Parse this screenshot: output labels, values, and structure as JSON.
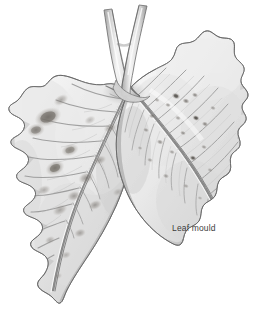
{
  "figure": {
    "title": "Leaf mould",
    "medium": "graphite pencil botanical illustration",
    "background_color": "#ffffff",
    "width": 259,
    "height": 312
  },
  "caption": {
    "label": "Leaf mould",
    "color": "#3b3b3b",
    "x": 172,
    "y": 223
  },
  "palette": {
    "background": "#ffffff",
    "outline": "#5a5a5a",
    "outline_dark": "#3f3f3f",
    "leaf_light": "#f2f2f2",
    "leaf_mid": "#d8d8d8",
    "leaf_shadow": "#b4b4b4",
    "vein": "#8c8c8c",
    "vein_dark": "#6e6e6e",
    "lesion": "#7a7570",
    "lesion_dark": "#58544f",
    "stem_light": "#ebebeb",
    "stem_shadow": "#a9a9a9"
  },
  "parts": [
    {
      "name": "petiole-left-branch",
      "label": "Left stem branch",
      "description": "slender stalk rising from the leaflet junction to the top edge"
    },
    {
      "name": "petiole-right-branch",
      "label": "Right stem branch",
      "description": "second slender stalk crossing the first near the top"
    },
    {
      "name": "leaflet-left",
      "label": "Left leaflet",
      "description": "large serrated leaflet angled down-left with dark blotchy lesions"
    },
    {
      "name": "leaflet-right",
      "label": "Right leaflet",
      "description": "serrated leaflet angled down-right with small scattered dark specks"
    },
    {
      "name": "midrib-left",
      "label": "Left leaflet midrib"
    },
    {
      "name": "midrib-right",
      "label": "Right leaflet midrib"
    }
  ],
  "lesions": {
    "left_leaflet": [
      {
        "cx": 48,
        "cy": 117,
        "rx": 11,
        "ry": 6.5,
        "rot": -22,
        "tone": 0.62
      },
      {
        "cx": 36,
        "cy": 130,
        "rx": 7,
        "ry": 5,
        "rot": -14,
        "tone": 0.48
      },
      {
        "cx": 61,
        "cy": 100,
        "rx": 6,
        "ry": 4,
        "rot": -30,
        "tone": 0.38
      },
      {
        "cx": 70,
        "cy": 150,
        "rx": 7,
        "ry": 5,
        "rot": -18,
        "tone": 0.46
      },
      {
        "cx": 55,
        "cy": 168,
        "rx": 8,
        "ry": 5.5,
        "rot": -25,
        "tone": 0.55
      },
      {
        "cx": 86,
        "cy": 178,
        "rx": 6,
        "ry": 4.5,
        "rot": -20,
        "tone": 0.44
      },
      {
        "cx": 74,
        "cy": 196,
        "rx": 5,
        "ry": 4,
        "rot": -16,
        "tone": 0.4
      },
      {
        "cx": 95,
        "cy": 205,
        "rx": 5,
        "ry": 3.5,
        "rot": -22,
        "tone": 0.42
      },
      {
        "cx": 60,
        "cy": 210,
        "rx": 6,
        "ry": 4,
        "rot": -28,
        "tone": 0.36
      },
      {
        "cx": 44,
        "cy": 190,
        "rx": 5,
        "ry": 3.5,
        "rot": -20,
        "tone": 0.34
      },
      {
        "cx": 80,
        "cy": 233,
        "rx": 4.5,
        "ry": 3.2,
        "rot": -18,
        "tone": 0.38
      },
      {
        "cx": 50,
        "cy": 240,
        "rx": 4,
        "ry": 3,
        "rot": -24,
        "tone": 0.3
      },
      {
        "cx": 100,
        "cy": 160,
        "rx": 5,
        "ry": 3.5,
        "rot": -20,
        "tone": 0.35
      },
      {
        "cx": 110,
        "cy": 128,
        "rx": 5,
        "ry": 3.5,
        "rot": -24,
        "tone": 0.4
      },
      {
        "cx": 66,
        "cy": 255,
        "rx": 4,
        "ry": 2.8,
        "rot": -20,
        "tone": 0.28
      }
    ],
    "right_leaflet": [
      {
        "cx": 176,
        "cy": 96,
        "rx": 3.0,
        "ry": 2.2,
        "rot": 20,
        "tone": 0.52
      },
      {
        "cx": 186,
        "cy": 101,
        "rx": 2.4,
        "ry": 1.8,
        "rot": 20,
        "tone": 0.48
      },
      {
        "cx": 195,
        "cy": 95,
        "rx": 2.2,
        "ry": 1.6,
        "rot": 20,
        "tone": 0.44
      },
      {
        "cx": 168,
        "cy": 105,
        "rx": 2.0,
        "ry": 1.5,
        "rot": 20,
        "tone": 0.4
      },
      {
        "cx": 196,
        "cy": 118,
        "rx": 2.6,
        "ry": 2.0,
        "rot": 20,
        "tone": 0.56
      },
      {
        "cx": 205,
        "cy": 124,
        "rx": 2.2,
        "ry": 1.7,
        "rot": 20,
        "tone": 0.46
      },
      {
        "cx": 183,
        "cy": 133,
        "rx": 2.0,
        "ry": 1.5,
        "rot": 20,
        "tone": 0.42
      },
      {
        "cx": 152,
        "cy": 116,
        "rx": 2.2,
        "ry": 1.7,
        "rot": 20,
        "tone": 0.38
      },
      {
        "cx": 146,
        "cy": 130,
        "rx": 2.0,
        "ry": 1.5,
        "rot": 20,
        "tone": 0.36
      },
      {
        "cx": 160,
        "cy": 142,
        "rx": 2.4,
        "ry": 1.8,
        "rot": 20,
        "tone": 0.4
      },
      {
        "cx": 172,
        "cy": 152,
        "rx": 2.0,
        "ry": 1.5,
        "rot": 20,
        "tone": 0.34
      },
      {
        "cx": 193,
        "cy": 158,
        "rx": 2.6,
        "ry": 1.9,
        "rot": 20,
        "tone": 0.5
      },
      {
        "cx": 150,
        "cy": 160,
        "rx": 2.0,
        "ry": 1.5,
        "rot": 20,
        "tone": 0.32
      },
      {
        "cx": 204,
        "cy": 147,
        "rx": 2.0,
        "ry": 1.5,
        "rot": 20,
        "tone": 0.36
      },
      {
        "cx": 166,
        "cy": 176,
        "rx": 2.2,
        "ry": 1.6,
        "rot": 20,
        "tone": 0.34
      },
      {
        "cx": 186,
        "cy": 186,
        "rx": 2.0,
        "ry": 1.5,
        "rot": 20,
        "tone": 0.3
      }
    ]
  }
}
